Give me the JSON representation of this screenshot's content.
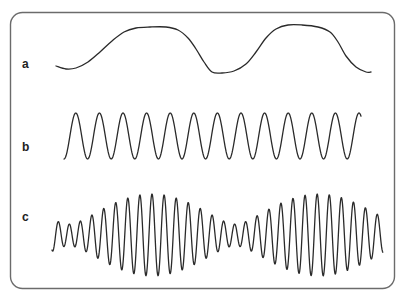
{
  "figure": {
    "frame": {
      "x": 10.5,
      "y": 12.5,
      "width": 384,
      "height": 276,
      "radius": 12,
      "stroke": "#6b6b6b"
    },
    "line_color": "#2a2a2a",
    "panels": [
      {
        "label": "a",
        "label_pos": {
          "x": 22,
          "y": 58
        },
        "description": "slow wave",
        "points": [
          [
            56,
            66
          ],
          [
            66,
            69
          ],
          [
            76,
            68
          ],
          [
            88,
            62
          ],
          [
            100,
            52
          ],
          [
            112,
            41
          ],
          [
            124,
            32
          ],
          [
            136,
            28
          ],
          [
            150,
            27
          ],
          [
            166,
            27
          ],
          [
            178,
            30
          ],
          [
            188,
            38
          ],
          [
            196,
            49
          ],
          [
            204,
            62
          ],
          [
            212,
            72
          ],
          [
            222,
            73
          ],
          [
            234,
            71
          ],
          [
            246,
            64
          ],
          [
            256,
            52
          ],
          [
            266,
            38
          ],
          [
            276,
            29
          ],
          [
            288,
            25
          ],
          [
            302,
            25
          ],
          [
            318,
            27
          ],
          [
            330,
            32
          ],
          [
            338,
            42
          ],
          [
            346,
            56
          ],
          [
            356,
            67
          ],
          [
            366,
            72
          ],
          [
            371,
            72
          ]
        ]
      },
      {
        "label": "b",
        "label_pos": {
          "x": 22,
          "y": 141
        },
        "description": "regular fast wave",
        "x_start": 64,
        "x_end": 361,
        "center_y": 136,
        "amplitude": 23,
        "period": 23.6,
        "phase_start": "trough"
      },
      {
        "label": "c",
        "label_pos": {
          "x": 22,
          "y": 211
        },
        "description": "beating wave (sum of two frequencies)",
        "x_start": 52,
        "x_end": 383,
        "center_y": 235,
        "components": [
          {
            "amplitude": 26,
            "period": 11.8
          },
          {
            "amplitude": 15,
            "period": 12.7
          }
        ],
        "in_phase_x": 152
      }
    ]
  }
}
